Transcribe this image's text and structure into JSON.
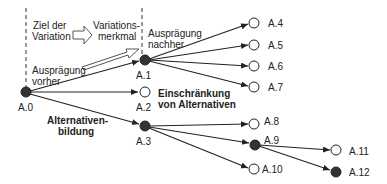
{
  "labels": {
    "ziel_1": "Ziel der",
    "ziel_2": "Variation",
    "merkmal_1": "Variations-",
    "merkmal_2": "merkmal",
    "vorher_1": "Ausprägung",
    "vorher_2": "vorher",
    "nachher_1": "Ausprägung",
    "nachher_2": "nachher",
    "einschraenkung_1": "Einschränkung",
    "einschraenkung_2": "von Alternativen",
    "bildung_1": "Alternativen-",
    "bildung_2": "bildung"
  },
  "nodes": {
    "a0": "A.0",
    "a1": "A.1",
    "a2": "A.2",
    "a3": "A.3",
    "a4": "A.4",
    "a5": "A.5",
    "a6": "A.6",
    "a7": "A.7",
    "a8": "A.8",
    "a9": "A.9",
    "a10": "A.10",
    "a11": "A.11",
    "a12": "A.12"
  },
  "colors": {
    "filled": "#333333",
    "stroke": "#222222"
  }
}
